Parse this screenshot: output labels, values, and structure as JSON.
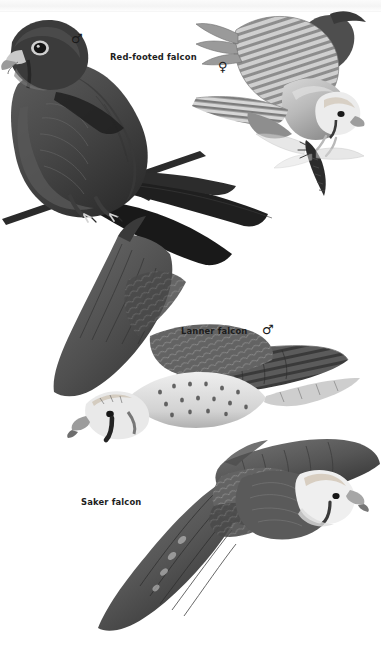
{
  "page": {
    "kind": "field-guide-plate",
    "background_color": "#ffffff",
    "ink_color": "#1d1d1d",
    "width": 381,
    "height": 645
  },
  "header": {
    "running_head": "",
    "folio": "",
    "band_color": "#f4f4f4"
  },
  "labels": {
    "red_footed_falcon": "Red-footed falcon",
    "lanner_falcon": "Lanner falcon",
    "saker_falcon": "Saker falcon"
  },
  "symbols": {
    "male": "♂",
    "female": "♀"
  },
  "figures": [
    {
      "id": "red-footed-falcon-male",
      "species": "Red-footed falcon",
      "sex": "male",
      "sex_symbol": "♂",
      "pose": "perched on branch",
      "tone": "dark slate grey",
      "label": "Red-footed falcon"
    },
    {
      "id": "red-footed-falcon-female",
      "species": "Red-footed falcon",
      "sex": "female",
      "sex_symbol": "♀",
      "pose": "in flight with dragonfly prey",
      "tone": "pale barred grey",
      "label": ""
    },
    {
      "id": "lanner-falcon-male",
      "species": "Lanner falcon",
      "sex": "male",
      "sex_symbol": "♂",
      "pose": "in flight, underside, banking",
      "tone": "mid grey with spotted underparts",
      "label": "Lanner falcon"
    },
    {
      "id": "saker-falcon",
      "species": "Saker falcon",
      "sex": "",
      "sex_symbol": "",
      "pose": "in flight, underside, wings spread",
      "tone": "dark grey with pale head",
      "label": "Saker falcon"
    }
  ],
  "palette": {
    "dark": "#2b2b2b",
    "mid": "#6e6e6e",
    "light": "#b6b6b6",
    "pale": "#dedede",
    "near_white": "#f1f1f1",
    "black": "#111111"
  }
}
